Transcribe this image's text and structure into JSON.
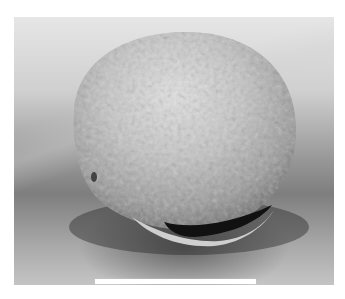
{
  "image": {
    "subject": "SEM micrograph of an ovoid seed/egg with textured surface and a slit-like opening",
    "colors": {
      "background_light": "#e6e6e6",
      "background_dark": "#7e7e7e",
      "object_surface": "#bdbdbd",
      "opening_dark": "#111111",
      "scale_bar": "#ffffff"
    }
  },
  "scale_bar": {
    "label": ""
  }
}
